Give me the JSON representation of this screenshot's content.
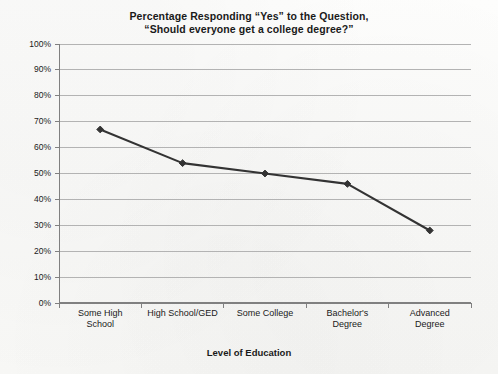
{
  "chart_data": {
    "type": "line",
    "title": "Percentage Responding “Yes” to the Question, “Should everyone get a college degree?”",
    "title_lines": [
      "Percentage Responding “Yes” to the Question,",
      "“Should everyone get a college degree?”"
    ],
    "xlabel": "Level of Education",
    "ylabel": "",
    "categories": [
      "Some High\nSchool",
      "High School/GED",
      "Some College",
      "Bachelor's\nDegree",
      "Advanced\nDegree"
    ],
    "values": [
      67,
      54,
      50,
      46,
      28
    ],
    "ylim": [
      0,
      100
    ],
    "ytick_values": [
      0,
      10,
      20,
      30,
      40,
      50,
      60,
      70,
      80,
      90,
      100
    ],
    "ytick_labels": [
      "0%",
      "10%",
      "20%",
      "30%",
      "40%",
      "50%",
      "60%",
      "70%",
      "80%",
      "90%",
      "100%"
    ],
    "grid": true,
    "grid_axis": "y",
    "legend": false,
    "marker": "diamond",
    "series_color": "#333333",
    "grid_color": "#b3b3b3",
    "axis_color": "#808080",
    "background_color": "#fbfbfa"
  }
}
